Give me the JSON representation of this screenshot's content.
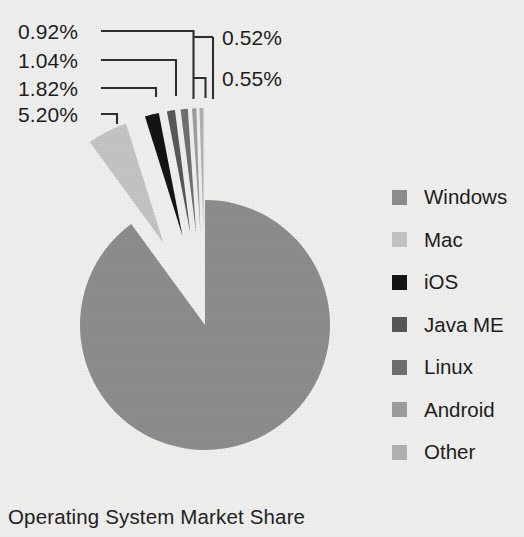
{
  "chart_data": {
    "type": "pie",
    "title": "Operating System Market Share",
    "xlabel": "",
    "ylabel": "",
    "value_unit": "%",
    "legend_position": "right",
    "grid": false,
    "exploded_slices": [
      "Mac",
      "iOS",
      "Java ME",
      "Linux",
      "Android",
      "Other"
    ],
    "categories": [
      "Windows",
      "Mac",
      "iOS",
      "Java ME",
      "Linux",
      "Android",
      "Other"
    ],
    "values": [
      89.95,
      5.2,
      1.82,
      1.04,
      0.92,
      0.55,
      0.52
    ],
    "labels_shown": [
      "",
      "5.20%",
      "1.82%",
      "1.04%",
      "0.92%",
      "0.55%",
      "0.52%"
    ],
    "colors": [
      "#8c8c8c",
      "#c3c3c3",
      "#141414",
      "#575757",
      "#6f6f6f",
      "#9c9c9c",
      "#b0b0b0"
    ],
    "slices": [
      {
        "name": "Windows",
        "value": 89.95,
        "label": "",
        "color": "#8c8c8c",
        "exploded": false
      },
      {
        "name": "Mac",
        "value": 5.2,
        "label": "5.20%",
        "color": "#c3c3c3",
        "exploded": true
      },
      {
        "name": "iOS",
        "value": 1.82,
        "label": "1.82%",
        "color": "#141414",
        "exploded": true
      },
      {
        "name": "Java ME",
        "value": 1.04,
        "label": "1.04%",
        "color": "#575757",
        "exploded": true
      },
      {
        "name": "Linux",
        "value": 0.92,
        "label": "0.92%",
        "color": "#6f6f6f",
        "exploded": true
      },
      {
        "name": "Android",
        "value": 0.55,
        "label": "0.55%",
        "color": "#9c9c9c",
        "exploded": true
      },
      {
        "name": "Other",
        "value": 0.52,
        "label": "0.52%",
        "color": "#b0b0b0",
        "exploded": true
      }
    ]
  },
  "callouts": [
    {
      "text": "0.92%",
      "side": "left"
    },
    {
      "text": "1.04%",
      "side": "left"
    },
    {
      "text": "1.82%",
      "side": "left"
    },
    {
      "text": "5.20%",
      "side": "left"
    },
    {
      "text": "0.52%",
      "side": "right"
    },
    {
      "text": "0.55%",
      "side": "right"
    }
  ],
  "legend": {
    "items": [
      {
        "label": "Windows",
        "color": "#8c8c8c"
      },
      {
        "label": "Mac",
        "color": "#c3c3c3"
      },
      {
        "label": "iOS",
        "color": "#141414"
      },
      {
        "label": "Java ME",
        "color": "#575757"
      },
      {
        "label": "Linux",
        "color": "#6f6f6f"
      },
      {
        "label": "Android",
        "color": "#9c9c9c"
      },
      {
        "label": "Other",
        "color": "#b0b0b0"
      }
    ]
  },
  "title": {
    "text": "Operating System Market Share"
  },
  "theme": {
    "background": "#eeeeec",
    "text": "#1e1e1e",
    "leader_line": "#303030"
  }
}
